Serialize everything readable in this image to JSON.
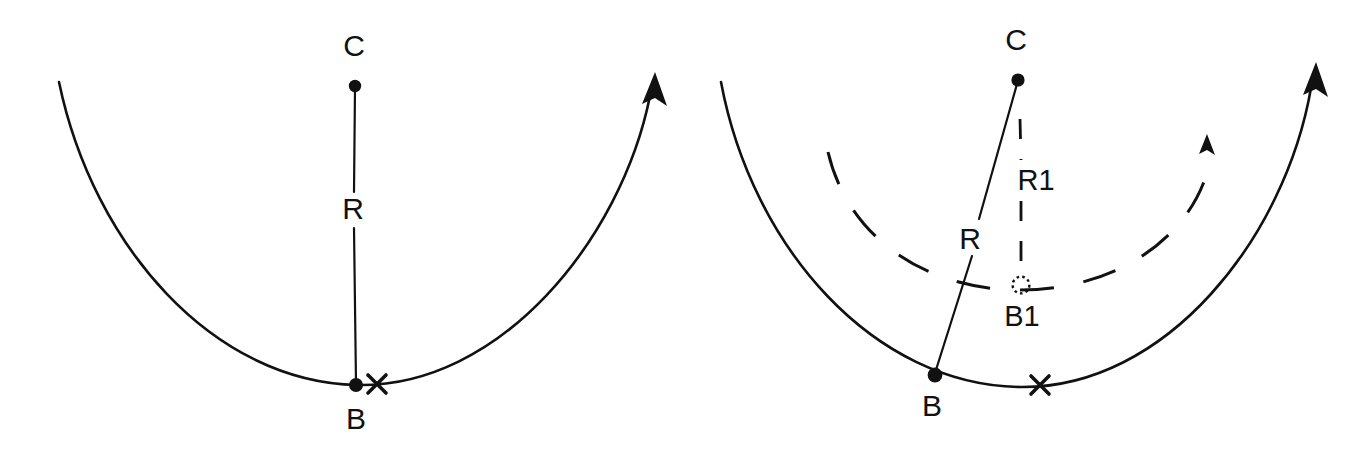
{
  "figure": {
    "background_color": "#ffffff",
    "ink_color": "#111111",
    "width": 1372,
    "height": 459
  },
  "panels": [
    {
      "id": "left",
      "name": "undeformed-arc-panel",
      "description": "Single solid circular arc with radius line R from center C to base point B, plus an x marker on the arc.",
      "labels": {
        "center": "C",
        "radius": "R",
        "base": "B"
      },
      "points": {
        "C": {
          "x": 355,
          "y": 86
        },
        "B": {
          "x": 356,
          "y": 385
        },
        "X": {
          "x": 377,
          "y": 384
        }
      },
      "label_positions": {
        "C": {
          "x": 354,
          "y": 48
        },
        "R": {
          "x": 353,
          "y": 210
        },
        "B": {
          "x": 356,
          "y": 420
        }
      },
      "arc": {
        "start": {
          "x": 59,
          "y": 82
        },
        "end": {
          "x": 655,
          "y": 82
        },
        "lowest": {
          "x": 357,
          "y": 385
        },
        "arrow_at": "end",
        "style": "solid"
      }
    },
    {
      "id": "right",
      "name": "deformed-arc-panel",
      "description": "Solid original arc with radius R from C to B, plus a dashed new arc with smaller radius R1 from C to new base point B1.",
      "labels": {
        "center": "C",
        "radius": "R",
        "radius_new": "R1",
        "base": "B",
        "base_new": "B1"
      },
      "points": {
        "C": {
          "x": 1018,
          "y": 80
        },
        "B": {
          "x": 935,
          "y": 375
        },
        "B1": {
          "x": 1021,
          "y": 285
        },
        "X": {
          "x": 1040,
          "y": 385
        }
      },
      "label_positions": {
        "C": {
          "x": 1016,
          "y": 42
        },
        "R": {
          "x": 970,
          "y": 240
        },
        "R1": {
          "x": 1035,
          "y": 181
        },
        "B": {
          "x": 932,
          "y": 407
        },
        "B1": {
          "x": 1021,
          "y": 317
        }
      },
      "arc_solid": {
        "start": {
          "x": 721,
          "y": 82
        },
        "end": {
          "x": 1316,
          "y": 72
        },
        "lowest": {
          "x": 1020,
          "y": 387
        },
        "arrow_at": "end",
        "style": "solid"
      },
      "arc_dashed": {
        "start": {
          "x": 828,
          "y": 152
        },
        "end": {
          "x": 1213,
          "y": 160
        },
        "lowest": {
          "x": 1020,
          "y": 290
        },
        "arrow_at": "end",
        "style": "dashed"
      }
    }
  ],
  "markers": {
    "x_marker_name": "x-cross-marker",
    "dot_marker_name": "filled-dot",
    "dotted_circle_name": "dotted-circle-marker"
  }
}
